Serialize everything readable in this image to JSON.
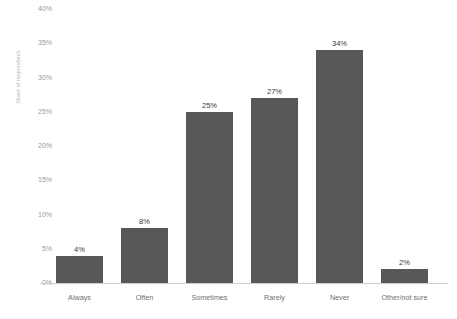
{
  "chart_data": {
    "type": "bar",
    "title": "",
    "subtitle": "",
    "xlabel": "",
    "ylabel": "Share of respondents",
    "categories": [
      "Always",
      "Often",
      "Sometimes",
      "Rarely",
      "Never",
      "Other/not sure"
    ],
    "values": [
      4,
      8,
      25,
      27,
      34,
      2
    ],
    "value_labels": [
      "4%",
      "8%",
      "25%",
      "27%",
      "34%",
      "2%"
    ],
    "ylim": [
      0,
      40
    ],
    "ytick_values": [
      0,
      5,
      10,
      15,
      20,
      25,
      30,
      35,
      40
    ],
    "ytick_labels": [
      "0%",
      "5%",
      "10%",
      "15%",
      "20%",
      "25%",
      "30%",
      "35%",
      "40%"
    ],
    "grid": false,
    "legend": "none",
    "bar_color": "#58585a",
    "background_color": "#ffffff",
    "axis_line_color": "#cfcfcf",
    "tick_label_color": "#9a9a9a",
    "axis_title_color": "#b6b6b6"
  }
}
